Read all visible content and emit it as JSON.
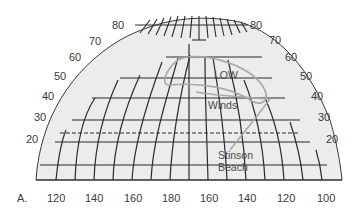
{
  "figure": {
    "panel_label": "A.",
    "background_color": "#ffffff",
    "globe_fill": "#ececec",
    "grid_color": "#2b2b2b",
    "path_color": "#a9a9a9"
  },
  "latitude_labels": {
    "left": [
      "80",
      "70",
      "60",
      "50",
      "40",
      "30",
      "20"
    ],
    "right": [
      "80",
      "70",
      "60",
      "50",
      "40",
      "30",
      "20"
    ]
  },
  "longitude_labels": [
    "120",
    "140",
    "160",
    "180",
    "160",
    "140",
    "120",
    "100"
  ],
  "annotations": {
    "low": "LOW",
    "winds": "Winds",
    "place_line1": "Stinson",
    "place_line2": "Beach"
  }
}
